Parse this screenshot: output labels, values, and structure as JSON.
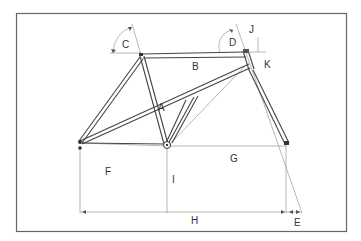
{
  "labels": {
    "A": "A",
    "B": "B",
    "C": "C",
    "D": "D",
    "E": "E",
    "F": "F",
    "G": "G",
    "H": "H",
    "I": "I",
    "J": "J",
    "K": "K"
  },
  "colors": {
    "frame": "#444444",
    "dimension": "#888888",
    "border": "#666666"
  }
}
